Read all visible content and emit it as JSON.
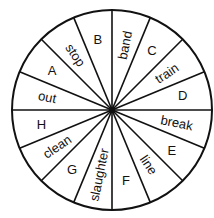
{
  "wheel": {
    "center": [
      112,
      110
    ],
    "radius": 100,
    "sector_count": 16,
    "line_color": "#111111",
    "sectors": [
      {
        "label": "band",
        "type": "word"
      },
      {
        "label": "C",
        "type": "letter"
      },
      {
        "label": "train",
        "type": "word"
      },
      {
        "label": "D",
        "type": "letter"
      },
      {
        "label": "break",
        "type": "word"
      },
      {
        "label": "E",
        "type": "letter"
      },
      {
        "label": "line",
        "type": "word"
      },
      {
        "label": "F",
        "type": "letter"
      },
      {
        "label": "slaughter",
        "type": "word"
      },
      {
        "label": "G",
        "type": "letter"
      },
      {
        "label": "clean",
        "type": "word"
      },
      {
        "label": "H",
        "type": "letter"
      },
      {
        "label": "out",
        "type": "word"
      },
      {
        "label": "A",
        "type": "letter"
      },
      {
        "label": "stop",
        "type": "word"
      },
      {
        "label": "B",
        "type": "letter"
      }
    ]
  }
}
